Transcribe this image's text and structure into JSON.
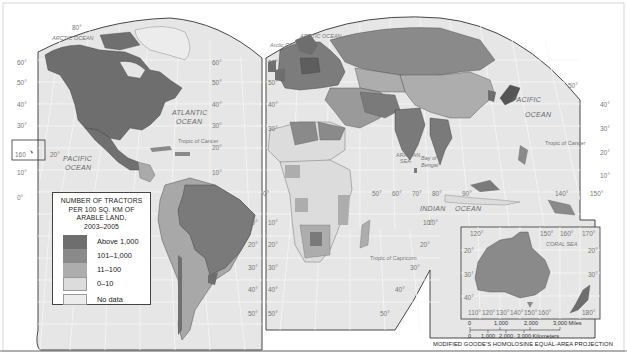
{
  "map": {
    "title": "Number of tractors per 100 sq. km of arable land, 2003-2005",
    "projection": "MODIFIED GOODE'S HOMOLOSINE EQUAL-AREA PROJECTION",
    "colors": {
      "above_1000": "#6e6e6e",
      "101_1000": "#8a8a8a",
      "11_100": "#adadad",
      "0_10": "#dcdcdc",
      "no_data": "#ececec",
      "ocean": "#e7e7e7",
      "graticule": "#f8f8f8",
      "border": "#3a3a3a"
    }
  },
  "legend": {
    "title_lines": [
      "NUMBER OF TRACTORS",
      "PER 100 SQ. KM OF",
      "ARABLE LAND,",
      "2003–2005"
    ],
    "items": [
      {
        "label": "Above 1,000",
        "color": "#6e6e6e"
      },
      {
        "label": "101–1,000",
        "color": "#8a8a8a"
      },
      {
        "label": "11–100",
        "color": "#adadad"
      },
      {
        "label": "0–10",
        "color": "#dcdcdc"
      },
      {
        "label": "No data",
        "color": "#ececec"
      }
    ]
  },
  "oceans": {
    "arctic_left": "ARCTIC OCEAN",
    "arctic_right": "ARCTIC OCEAN",
    "arctic_circle": "Arctic Circle",
    "atlantic_1": "ATLANTIC",
    "atlantic_2": "OCEAN",
    "pacific_left_1": "PACIFIC",
    "pacific_left_2": "OCEAN",
    "pacific_right_1": "PACIFIC",
    "pacific_right_2": "OCEAN",
    "indian_1": "INDIAN",
    "indian_2": "OCEAN",
    "arabian_1": "ARABIAN",
    "arabian_2": "SEA",
    "bengal_1": "Bay of",
    "bengal_2": "Bengal",
    "coral": "CORAL SEA",
    "tropic_cancer_left": "Tropic of Cancer",
    "tropic_cancer_right": "Tropic of Cancer",
    "tropic_capricorn": "Tropic of Capricorn"
  },
  "latitudes": {
    "left_west": [
      "60°",
      "50°",
      "40°",
      "30°",
      "20°",
      "10°",
      "0°"
    ],
    "americas_right": [
      "60°",
      "50°",
      "40°",
      "30°",
      "20°",
      "10°"
    ],
    "sa_right": [
      "10°",
      "20°",
      "30°",
      "40°",
      "50°"
    ],
    "africa_left": [
      "60°",
      "50°",
      "40°",
      "30°",
      "10°",
      "20°",
      "30°",
      "40°",
      "50°"
    ],
    "asia_right": [
      "50°",
      "40°",
      "30°",
      "20°",
      "10°"
    ],
    "africa_right": [
      "10°",
      "20°",
      "30°",
      "40°",
      "50°"
    ],
    "hawaii": "160",
    "top_80": "80°",
    "pacific_20": "20°",
    "left_lower": [
      "10°",
      "20°",
      "30°",
      "40°",
      "50°"
    ]
  },
  "longitudes": {
    "indian": [
      "50°",
      "60°",
      "70°",
      "80°",
      "90°",
      "140°",
      "150°",
      "0°"
    ],
    "indian_10": "10°"
  },
  "inset": {
    "top_labels": [
      "120°",
      "150°",
      "160°",
      "170°"
    ],
    "left_labels": [
      "20°",
      "30°",
      "40°"
    ],
    "right_labels": [
      "20°",
      "30°"
    ],
    "bottom_labels": [
      "110°",
      "120°",
      "130°",
      "140°",
      "150°",
      "160°",
      "180°"
    ]
  },
  "scale": {
    "miles_ticks": [
      "0",
      "1,000",
      "2,000",
      "3,000 Miles"
    ],
    "km_ticks": [
      "0",
      "1,000",
      "2,000",
      "3,000 Kilometers"
    ]
  }
}
